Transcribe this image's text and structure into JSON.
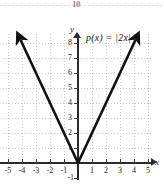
{
  "figure": {
    "kind": "math-graph",
    "function_label": "p(x) = |2x|",
    "axis_label_x": "x",
    "axis_label_y": "y",
    "top_artifact": "10"
  },
  "axes": {
    "x_ticks": [
      "-5",
      "-4",
      "-3",
      "-2",
      "-1",
      "1",
      "2",
      "3",
      "4",
      "5"
    ],
    "y_ticks": [
      "8",
      "7",
      "6",
      "5",
      "4",
      "3",
      "2",
      "1",
      "-1"
    ]
  },
  "chart_data": {
    "type": "line",
    "title": "p(x) = |2x|",
    "xlabel": "x",
    "ylabel": "y",
    "xlim": [
      -5.2,
      5.4
    ],
    "ylim": [
      -1.4,
      8.8
    ],
    "grid": true,
    "legend": "none",
    "x_ticks": [
      -5,
      -4,
      -3,
      -2,
      -1,
      1,
      2,
      3,
      4,
      5
    ],
    "y_ticks": [
      1,
      2,
      3,
      4,
      5,
      6,
      7,
      8,
      -1
    ],
    "annotations": [
      {
        "text": "p(x) = |2x|",
        "x": 1.2,
        "y": 8.4
      }
    ],
    "series": [
      {
        "name": "p(x) = |2x|",
        "expression": "p(x) = |2x|",
        "color": "#111111",
        "linewidth": 2.6,
        "arrow_start": true,
        "arrow_end": true,
        "x": [
          -4.1,
          0,
          4.1
        ],
        "values": [
          8.2,
          0,
          8.2
        ],
        "vertex": [
          0,
          0
        ]
      }
    ]
  }
}
